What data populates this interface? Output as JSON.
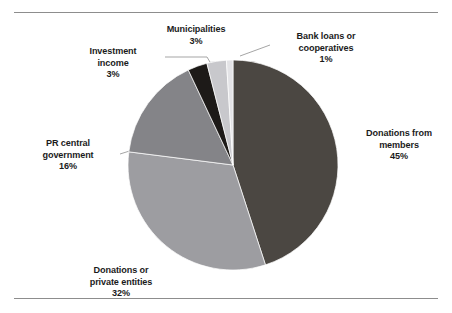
{
  "figure": {
    "title": "",
    "background": "#ffffff",
    "has_top_rule": true,
    "has_bottom_rule": true,
    "rule_color": "#8d8d8d"
  },
  "chart_data": {
    "type": "pie",
    "title": "",
    "xlabel": "",
    "ylabel": "",
    "legend_position": "none",
    "labels_position": "outside",
    "start_angle_deg": 0,
    "direction": "clockwise",
    "categories": [
      "Donations from members",
      "Donations or private entities",
      "PR central government",
      "Investment income",
      "Municipalities",
      "Bank loans or cooperatives"
    ],
    "values": [
      45,
      32,
      16,
      3,
      3,
      1
    ],
    "value_suffix": "%",
    "colors": [
      "#4b4742",
      "#9d9da1",
      "#848488",
      "#1d1a18",
      "#c8c8cc",
      "#e3e3e6"
    ],
    "slices": [
      {
        "label": "Donations from members",
        "label_lines": [
          "Donations from",
          "members"
        ],
        "value": 45,
        "value_text": "45%",
        "color": "#4b4742"
      },
      {
        "label": "Donations or private entities",
        "label_lines": [
          "Donations or",
          "private entities"
        ],
        "value": 32,
        "value_text": "32%",
        "color": "#9d9da1"
      },
      {
        "label": "PR central government",
        "label_lines": [
          "PR central",
          "government"
        ],
        "value": 16,
        "value_text": "16%",
        "color": "#848488"
      },
      {
        "label": "Investment income",
        "label_lines": [
          "Investment",
          "income"
        ],
        "value": 3,
        "value_text": "3%",
        "color": "#1d1a18"
      },
      {
        "label": "Municipalities",
        "label_lines": [
          "Municipalities"
        ],
        "value": 3,
        "value_text": "3%",
        "color": "#c8c8cc"
      },
      {
        "label": "Bank loans or cooperatives",
        "label_lines": [
          "Bank loans or",
          "cooperatives"
        ],
        "value": 1,
        "value_text": "1%",
        "color": "#e3e3e6"
      }
    ]
  },
  "labels": {
    "municipalities": "Municipalities\n3%",
    "bank_loans": "Bank loans or\ncooperatives\n1%",
    "investment_income": "Investment\nincome\n3%",
    "pr_central_government": "PR central\ngovernment\n16%",
    "donations_from_members": "Donations from\nmembers\n45%",
    "donations_private_entities": "Donations or\nprivate entities\n32%"
  }
}
